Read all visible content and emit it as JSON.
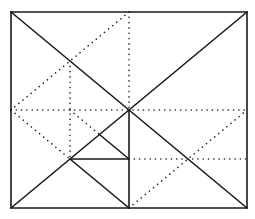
{
  "diagram": {
    "stroke_color": "#1a1a1a",
    "background": "#ffffff",
    "points": {
      "TL": [
        0,
        0
      ],
      "TR": [
        4,
        0
      ],
      "BL": [
        0,
        4
      ],
      "BR": [
        4,
        4
      ],
      "C": [
        2,
        2
      ],
      "TM": [
        2,
        0
      ],
      "BM": [
        2,
        4
      ],
      "LM": [
        0,
        2
      ],
      "RM": [
        4,
        2
      ],
      "P1": [
        1,
        1
      ],
      "P2": [
        1,
        2
      ],
      "P3": [
        1,
        3
      ],
      "P4": [
        1.5,
        2.5
      ],
      "P5": [
        2,
        3
      ]
    },
    "solid_segments": [
      {
        "name": "border-top",
        "from": "TL",
        "to": "TR"
      },
      {
        "name": "border-right",
        "from": "TR",
        "to": "BR"
      },
      {
        "name": "border-bottom",
        "from": "BR",
        "to": "BL"
      },
      {
        "name": "border-left",
        "from": "BL",
        "to": "TL"
      },
      {
        "name": "diagonal-tl-br",
        "from": "TL",
        "to": "BR"
      },
      {
        "name": "diagonal-bl-tr",
        "from": "BL",
        "to": "TR"
      },
      {
        "name": "center-to-bottom-mid",
        "from": "C",
        "to": "BM"
      },
      {
        "name": "small-horizontal",
        "from": "P3",
        "to": "P5"
      },
      {
        "name": "small-diagonal",
        "from": "P4",
        "to": "P5"
      },
      {
        "name": "lower-diagonal",
        "from": "P3",
        "to": "BM"
      }
    ],
    "dotted_segments": [
      {
        "name": "midline-horizontal",
        "from": "LM",
        "to": "RM"
      },
      {
        "name": "midline-vertical-upper",
        "from": "TM",
        "to": "C"
      },
      {
        "name": "dotted-top-mid-to-left-mid",
        "from": "TM",
        "to": "LM"
      },
      {
        "name": "dotted-left-mid-to-p3",
        "from": "LM",
        "to": "P3"
      },
      {
        "name": "dotted-vertical-quarter",
        "from": "P1",
        "to": "P3"
      },
      {
        "name": "dotted-p2-to-p4",
        "from": "P2",
        "to": "P4"
      },
      {
        "name": "dotted-horizontal-lower-right",
        "from": "P5",
        "to": [
          4,
          3
        ]
      },
      {
        "name": "dotted-bottom-mid-to-right-mid",
        "from": "BM",
        "to": "RM"
      }
    ]
  }
}
